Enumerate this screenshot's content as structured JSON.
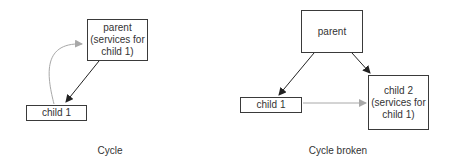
{
  "diagrams": [
    {
      "id": "cycle",
      "caption": "Cycle",
      "nodes": [
        {
          "id": "parent",
          "label": "parent\n(services for\nchild 1)"
        },
        {
          "id": "child1",
          "label": "child 1"
        }
      ],
      "edges": [
        {
          "from": "parent",
          "to": "child1",
          "style": "solid-black"
        },
        {
          "from": "child1",
          "to": "parent",
          "style": "gray-curved"
        }
      ]
    },
    {
      "id": "cycle-broken",
      "caption": "Cycle broken",
      "nodes": [
        {
          "id": "parent",
          "label": "parent"
        },
        {
          "id": "child1",
          "label": "child 1"
        },
        {
          "id": "child2",
          "label": "child 2\n(services for\nchild 1)"
        }
      ],
      "edges": [
        {
          "from": "parent",
          "to": "child1",
          "style": "solid-black"
        },
        {
          "from": "parent",
          "to": "child2",
          "style": "solid-black"
        },
        {
          "from": "child1",
          "to": "child2",
          "style": "gray"
        }
      ]
    }
  ],
  "colors": {
    "box_border": "#3a3a3a",
    "arrow_black": "#222222",
    "arrow_gray": "#a8a8a8",
    "text": "#333333"
  }
}
